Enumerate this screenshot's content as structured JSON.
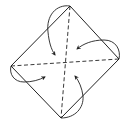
{
  "diagram": {
    "type": "origami-fold-diagram",
    "stroke_color": "#222222",
    "background": "#ffffff",
    "vertices": {
      "top": [
        70,
        6
      ],
      "right": [
        119,
        59
      ],
      "bottom": [
        61,
        118
      ],
      "left": [
        11,
        66
      ]
    },
    "center": [
      66,
      62
    ],
    "creases": [
      {
        "name": "vertical-diagonal",
        "style": "dashed",
        "from": "top",
        "to": "bottom"
      },
      {
        "name": "horizontal-diagonal",
        "style": "dashed",
        "from": "left",
        "to": "right"
      }
    ],
    "arrows": [
      {
        "name": "fold-top-corner",
        "from_corner": "top",
        "to": "center"
      },
      {
        "name": "fold-right-corner",
        "from_corner": "right",
        "to": "center"
      },
      {
        "name": "fold-bottom-corner",
        "from_corner": "bottom",
        "to": "center"
      },
      {
        "name": "fold-left-corner",
        "from_corner": "left",
        "to": "center"
      }
    ]
  }
}
